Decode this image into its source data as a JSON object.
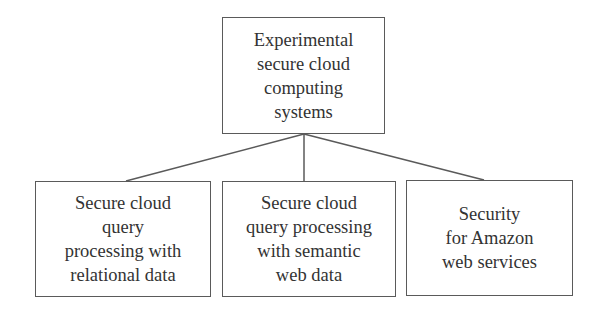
{
  "diagram": {
    "type": "hierarchy",
    "root": {
      "lines": [
        "Experimental",
        "secure cloud",
        "computing",
        "systems"
      ]
    },
    "children": [
      {
        "lines": [
          "Secure cloud",
          "query",
          "processing with",
          "relational data"
        ]
      },
      {
        "lines": [
          "Secure cloud",
          "query processing",
          "with semantic",
          "web data"
        ]
      },
      {
        "lines": [
          "Security",
          "for Amazon",
          "web services"
        ]
      }
    ],
    "colors": {
      "border": "#5a5a5a",
      "text": "#333333",
      "line": "#5a5a5a",
      "background": "#ffffff"
    }
  }
}
